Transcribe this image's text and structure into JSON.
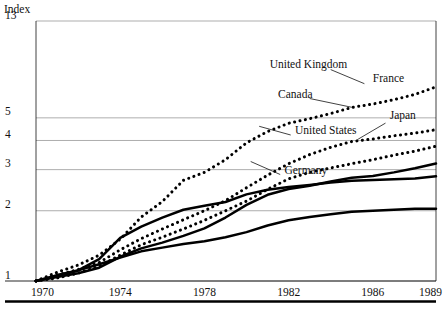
{
  "chart_data": {
    "type": "line",
    "title": "",
    "ylabel": "Index",
    "xlabel": "",
    "yscale": "log",
    "ylim": [
      1,
      13
    ],
    "xlim": [
      1970,
      1989
    ],
    "grid": true,
    "legend_position": "inline-labels",
    "x": [
      1970,
      1971,
      1972,
      1973,
      1974,
      1975,
      1976,
      1977,
      1978,
      1979,
      1980,
      1981,
      1982,
      1983,
      1984,
      1985,
      1986,
      1987,
      1988,
      1989
    ],
    "y_ticks": [
      1,
      2,
      3,
      4,
      5,
      13
    ],
    "y_tick_labels": [
      "1",
      "2",
      "3",
      "4",
      "5",
      "13"
    ],
    "x_ticks": [
      1970,
      1974,
      1978,
      1982,
      1986,
      1989
    ],
    "x_tick_labels": [
      "1970",
      "1974",
      "1978",
      "1982",
      "1986",
      "1989"
    ],
    "series": [
      {
        "name": "United Kingdom",
        "style": "dotted",
        "label_x": 1981.1,
        "label_y": 8.2,
        "values": [
          1.0,
          1.09,
          1.17,
          1.29,
          1.51,
          1.88,
          2.19,
          2.7,
          2.92,
          3.31,
          3.91,
          4.37,
          4.74,
          4.96,
          5.22,
          5.54,
          5.73,
          5.98,
          6.3,
          6.79
        ]
      },
      {
        "name": "France",
        "style": "dotted",
        "label_x": 1986.0,
        "label_y": 7.1,
        "values": [
          1.0,
          1.06,
          1.12,
          1.2,
          1.36,
          1.52,
          1.67,
          1.83,
          2.0,
          2.21,
          2.51,
          2.84,
          3.18,
          3.48,
          3.74,
          3.96,
          4.06,
          4.19,
          4.3,
          4.45
        ]
      },
      {
        "name": "Canada",
        "style": "dotted",
        "label_x": 1981.5,
        "label_y": 6.1,
        "values": [
          1.0,
          1.03,
          1.08,
          1.16,
          1.29,
          1.43,
          1.54,
          1.67,
          1.82,
          2.0,
          2.2,
          2.47,
          2.74,
          2.92,
          3.05,
          3.18,
          3.31,
          3.46,
          3.6,
          3.78
        ]
      },
      {
        "name": "Japan",
        "style": "solid",
        "label_x": 1986.8,
        "label_y": 4.95,
        "values": [
          1.0,
          1.06,
          1.11,
          1.24,
          1.53,
          1.71,
          1.87,
          2.02,
          2.1,
          2.18,
          2.35,
          2.46,
          2.53,
          2.58,
          2.64,
          2.69,
          2.71,
          2.73,
          2.75,
          2.81
        ]
      },
      {
        "name": "United States",
        "style": "solid",
        "label_x": 1982.3,
        "label_y": 4.25,
        "values": [
          1.0,
          1.04,
          1.08,
          1.14,
          1.27,
          1.38,
          1.46,
          1.56,
          1.68,
          1.87,
          2.12,
          2.34,
          2.48,
          2.56,
          2.67,
          2.77,
          2.82,
          2.92,
          3.04,
          3.19
        ]
      },
      {
        "name": "Germany",
        "style": "solid",
        "label_x": 1981.8,
        "label_y": 2.88,
        "values": [
          1.0,
          1.05,
          1.11,
          1.18,
          1.26,
          1.34,
          1.39,
          1.44,
          1.48,
          1.54,
          1.62,
          1.73,
          1.82,
          1.88,
          1.93,
          1.98,
          2.0,
          2.02,
          2.04,
          2.04
        ]
      }
    ]
  },
  "axes": {
    "y_axis_title": "Index"
  }
}
